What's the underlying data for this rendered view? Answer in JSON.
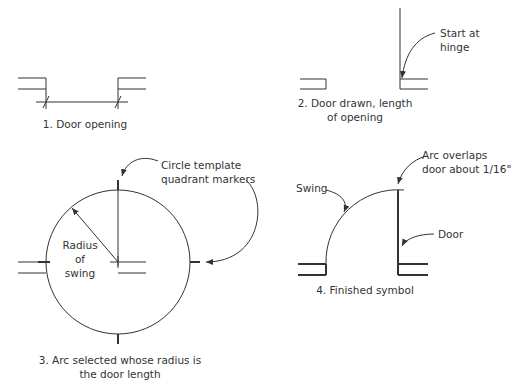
{
  "panels": [
    {
      "id": 1,
      "caption_line1": "1. Door opening",
      "caption_line2": ""
    },
    {
      "id": 2,
      "caption_line1": "2. Door drawn, length",
      "caption_line2": "of opening",
      "callout_line1": "Start at",
      "callout_line2": "hinge"
    },
    {
      "id": 3,
      "caption_line1": "3. Arc selected whose radius is",
      "caption_line2": "the door length",
      "callout_line1": "Circle template",
      "callout_line2": "quadrant markers",
      "radius_line1": "Radius",
      "radius_line2": "of",
      "radius_line3": "swing"
    },
    {
      "id": 4,
      "caption_line1": "4. Finished symbol",
      "swing_label": "Swing",
      "overlap_line1": "Arc overlaps",
      "overlap_line2": "door about 1/16\"",
      "door_label": "Door"
    }
  ],
  "colors": {
    "line": "#333333",
    "text": "#333333",
    "background": "#ffffff"
  }
}
